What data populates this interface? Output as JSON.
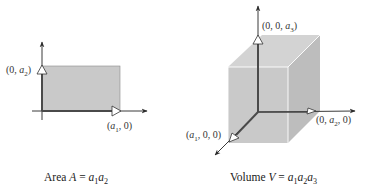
{
  "diagram": {
    "colors": {
      "fill": "#c9c9c9",
      "fill_top": "#d3d3d3",
      "fill_side": "#bdbdbd",
      "axis": "#3a3a3a",
      "highlight_axis": "#555555",
      "edge": "#ffffff"
    },
    "area_panel": {
      "point_y": {
        "prefix": "(0, ",
        "var": "a",
        "sub": "2",
        "suffix": ")"
      },
      "point_x": {
        "prefix": "(",
        "var": "a",
        "sub": "1",
        "suffix": ", 0)"
      },
      "caption": {
        "text": "Area ",
        "sym": "A",
        "eq": " = ",
        "terms": [
          {
            "var": "a",
            "sub": "1"
          },
          {
            "var": "a",
            "sub": "2"
          }
        ]
      }
    },
    "volume_panel": {
      "point_z": {
        "prefix": "(0, 0, ",
        "var": "a",
        "sub": "3",
        "suffix": ")"
      },
      "point_y": {
        "prefix": "(0, ",
        "var": "a",
        "sub": "2",
        "suffix": ", 0)"
      },
      "point_x": {
        "prefix": "(",
        "var": "a",
        "sub": "1",
        "suffix": ", 0, 0)"
      },
      "caption": {
        "text": "Volume ",
        "sym": "V",
        "eq": " = ",
        "terms": [
          {
            "var": "a",
            "sub": "1"
          },
          {
            "var": "a",
            "sub": "2"
          },
          {
            "var": "a",
            "sub": "3"
          }
        ]
      }
    }
  }
}
